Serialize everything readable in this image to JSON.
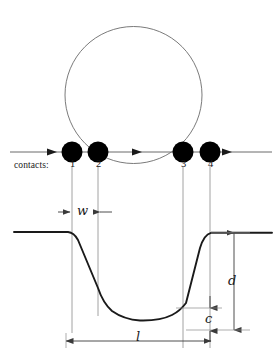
{
  "figure": {
    "type": "technical-line-diagram",
    "colors": {
      "ink": "#1a1a1a",
      "thin_line": "#6b6b6b",
      "background": "#ffffff",
      "contact_fill": "#000000"
    },
    "tip": {
      "shape": "circle",
      "cx": 133.5,
      "cy": 95,
      "r": 68.5,
      "stroke_width": 0.8
    },
    "surface_line": {
      "y": 152,
      "x_start": 10,
      "x_end": 272,
      "arrow_positions": [
        55,
        140,
        230
      ]
    },
    "contacts": {
      "label": "contacts:",
      "label_x": 14,
      "label_y": 166,
      "radius": 10.5,
      "cy": 152,
      "points": [
        {
          "id": "1",
          "x": 72
        },
        {
          "id": "2",
          "x": 98
        },
        {
          "id": "3",
          "x": 183
        },
        {
          "id": "4",
          "x": 210
        }
      ]
    },
    "guide_lines": {
      "y_top": 168,
      "y_bottom": 348,
      "x_positions": [
        72,
        98,
        183,
        210
      ]
    },
    "dimensions": [
      {
        "name": "w",
        "label": "w",
        "x": 78,
        "y": 205,
        "orientation": "horizontal",
        "from": 72,
        "to": 98
      },
      {
        "name": "d",
        "label": "d",
        "x": 231,
        "y": 281,
        "orientation": "vertical",
        "from": 232,
        "to": 330
      },
      {
        "name": "c",
        "label": "c",
        "x": 206,
        "y": 318,
        "orientation": "vertical",
        "from": 308,
        "to": 330
      },
      {
        "name": "l",
        "label": "l",
        "x": 138,
        "y": 338,
        "orientation": "horizontal",
        "from": 66,
        "to": 211
      }
    ],
    "profile": {
      "flat_left_y": 232,
      "flat_right_y": 232,
      "trench_bottom_y": 320,
      "left_shoulder_x": 72,
      "right_shoulder_x": 208,
      "stroke_width": 1.9
    }
  }
}
